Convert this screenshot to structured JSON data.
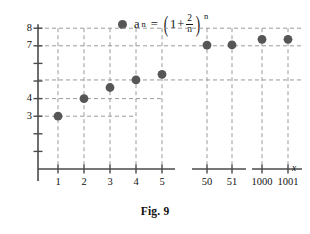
{
  "figure": {
    "caption": "Fig. 9",
    "legend": {
      "marker_name": "series-marker",
      "var": "a",
      "var_sub": "n",
      "equals": "=",
      "open_paren": "(",
      "one": "1",
      "plus": "+",
      "frac_num": "2",
      "frac_den": "n",
      "close_paren": ")",
      "exponent": "n"
    }
  },
  "colors": {
    "marker": "#565656",
    "axis": "#4a4a4a",
    "grid": "#9a9a9a",
    "text": "#111111"
  },
  "chart_data": {
    "type": "scatter",
    "title": "",
    "subtitle": "",
    "xlabel": "x",
    "ylabel": "",
    "legend_entries": [
      "a_n = (1 + 2/n)^n"
    ],
    "legend_position": "top-center",
    "grid": true,
    "grid_style": "dashed",
    "axis_break": true,
    "note": "x-axis is drawn in three broken segments: 1-5, 50-51, 1000-1001",
    "ylim": [
      0,
      8
    ],
    "yticks_labeled": [
      3,
      4,
      7,
      8
    ],
    "yticks_all": [
      1,
      2,
      3,
      4,
      5,
      6,
      7,
      8
    ],
    "ytick_labels": [
      "3",
      "4",
      "7",
      "8"
    ],
    "xticks": [
      1,
      2,
      3,
      4,
      5,
      50,
      51,
      1000,
      1001
    ],
    "xtick_labels": [
      "1",
      "2",
      "3",
      "4",
      "5",
      "50",
      "51",
      "1000",
      "1001"
    ],
    "categories": [
      "1",
      "2",
      "3",
      "4",
      "5",
      "50",
      "51",
      "1000",
      "1001"
    ],
    "values": [
      3.0,
      4.0,
      4.63,
      5.06,
      5.38,
      7.04,
      7.05,
      7.37,
      7.37
    ],
    "points": [
      {
        "n": 1,
        "x_tick": "1",
        "y": 3.0
      },
      {
        "n": 2,
        "x_tick": "2",
        "y": 4.0
      },
      {
        "n": 3,
        "x_tick": "3",
        "y": 4.63
      },
      {
        "n": 4,
        "x_tick": "4",
        "y": 5.06
      },
      {
        "n": 5,
        "x_tick": "5",
        "y": 5.38
      },
      {
        "n": 50,
        "x_tick": "50",
        "y": 7.04
      },
      {
        "n": 51,
        "x_tick": "51",
        "y": 7.05
      },
      {
        "n": 1000,
        "x_tick": "1000",
        "y": 7.37
      },
      {
        "n": 1001,
        "x_tick": "1001",
        "y": 7.37
      }
    ]
  }
}
